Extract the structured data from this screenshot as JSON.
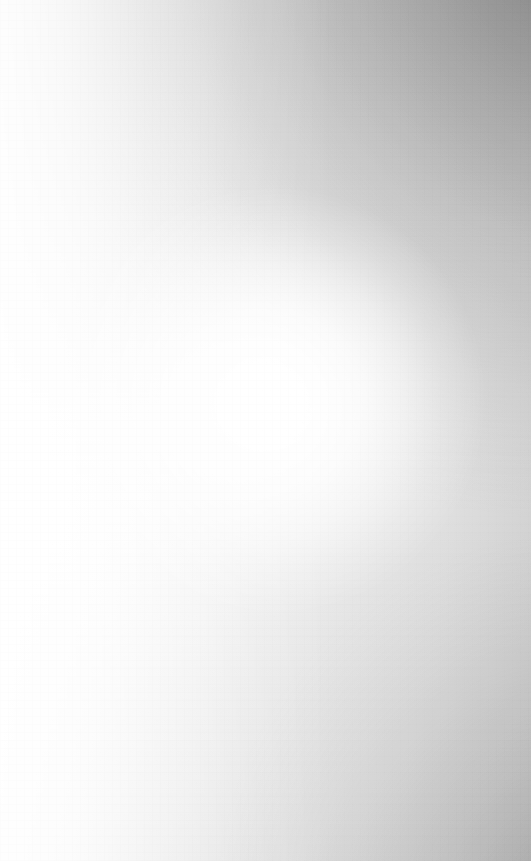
{
  "screen": {
    "width": 531,
    "height": 861,
    "state": "blank",
    "content_text": "",
    "description": "Blank screen with no rendered interface elements"
  },
  "appearance": {
    "base_color": "#fbfbfb",
    "highlight_color": "#ffffff",
    "edge_shadow_color": "#b0b0b0",
    "bottom_right_shadow_color": "#bdbdbd",
    "right_mid_color": "#dcdcdc",
    "top_center_color": "#e4e4e4",
    "left_edge_color": "#fdfdfd",
    "hotspot_x": 271,
    "hotspot_y": 401,
    "hotspot_radius": 215
  }
}
